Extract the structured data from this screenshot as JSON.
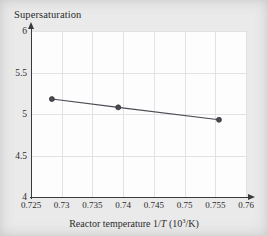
{
  "chart_data": {
    "type": "line",
    "title": "Supersaturation",
    "xlabel_plain": "Reactor temperature 1/T (10^3/K)",
    "xlabel_parts": {
      "lead": "Reactor temperature 1/",
      "italic": "T",
      "paren_open": " (10",
      "exponent": "3",
      "paren_close": "/K)"
    },
    "ylabel": "Supersaturation",
    "x": [
      0.7284,
      0.7392,
      0.7556
    ],
    "values": [
      5.18,
      5.08,
      4.93
    ],
    "xlim": [
      0.725,
      0.76
    ],
    "ylim": [
      4,
      6
    ],
    "xticks": [
      "0.725",
      "0.73",
      "0.735",
      "0.74",
      "0.745",
      "0.75",
      "0.755",
      "0.76"
    ],
    "xtick_values": [
      0.725,
      0.73,
      0.735,
      0.74,
      0.745,
      0.75,
      0.755,
      0.76
    ],
    "yticks": [
      "4",
      "4.5",
      "5",
      "5.5",
      "6"
    ],
    "ytick_values": [
      4,
      4.5,
      5,
      5.5,
      6
    ],
    "grid": true,
    "legend": null,
    "marker": "circle",
    "series_color": "#4a4a52",
    "grid_color": "#e2e2e6",
    "axis_color": "#3a3a3a",
    "plot_background": "#fdfdfd",
    "page_background": "#e9e9e9"
  }
}
